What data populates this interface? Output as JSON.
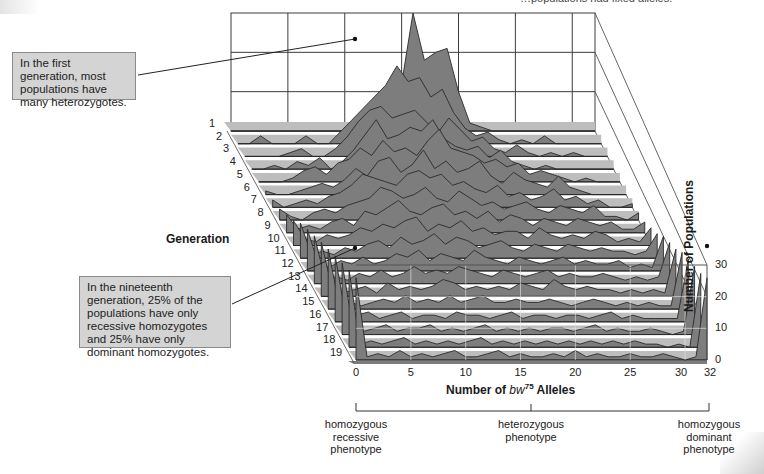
{
  "header_fragment": "…populations had fixed alleles.",
  "callouts": {
    "first": "In the first generation, most populations have many heterozygotes.",
    "nineteenth": "In the nineteenth generation, 25% of the populations have only recessive homozygotes and 25% have only dominant homozygotes."
  },
  "axes": {
    "generation_title": "Generation",
    "x_title_prefix": "Number of ",
    "x_title_gene": "bw",
    "x_title_sup": "75",
    "x_title_suffix": " Alleles",
    "y_title": "Number of Populations"
  },
  "phenotypes": {
    "recessive": "homozygous recessive phenotype",
    "heterozygous": "heterozygous phenotype",
    "dominant": "homozygous dominant phenotype"
  },
  "colors": {
    "fill": "#7d7d7d",
    "floor": "#bdbdbd",
    "edge": "#2a2a2a",
    "grid": "#3c3c3c",
    "front_grid": "#e8e8e8",
    "callout_bg": "#d4d4d4"
  },
  "chart_data": {
    "type": "area",
    "xlabel": "Number of bw75 Alleles",
    "ylabel": "Number of Populations",
    "zlabel": "Generation",
    "x_ticks": [
      "0",
      "5",
      "10",
      "15",
      "20",
      "25",
      "30",
      "32"
    ],
    "y_ticks": [
      "0",
      "10",
      "20",
      "30"
    ],
    "generation_ticks": [
      "1",
      "2",
      "3",
      "4",
      "5",
      "6",
      "7",
      "8",
      "9",
      "10",
      "11",
      "12",
      "13",
      "14",
      "15",
      "16",
      "17",
      "18",
      "19"
    ],
    "xlim": [
      0,
      32
    ],
    "ylim": [
      0,
      30
    ],
    "grid": true,
    "x": [
      0,
      1,
      2,
      3,
      4,
      5,
      6,
      7,
      8,
      9,
      10,
      11,
      12,
      13,
      14,
      15,
      16,
      17,
      18,
      19,
      20,
      21,
      22,
      23,
      24,
      25,
      26,
      27,
      28,
      29,
      30,
      31,
      32
    ],
    "series": [
      {
        "name": "Generation 1",
        "values": [
          0,
          0,
          0,
          0,
          0,
          0,
          0,
          0,
          0,
          0,
          0,
          0,
          2,
          4,
          8,
          12,
          30,
          18,
          20,
          21,
          10,
          2,
          1,
          0,
          0,
          0,
          0,
          0,
          0,
          0,
          0,
          0,
          0
        ]
      },
      {
        "name": "Generation 2",
        "values": [
          0,
          0,
          2,
          0,
          0,
          0,
          2,
          0,
          0,
          3,
          6,
          9,
          12,
          15,
          20,
          16,
          17,
          12,
          14,
          8,
          4,
          2,
          3,
          1,
          0,
          1,
          0,
          2,
          0,
          0,
          0,
          0,
          0
        ]
      },
      {
        "name": "Generation 3",
        "values": [
          0,
          0,
          0,
          0,
          1,
          2,
          0,
          0,
          2,
          5,
          9,
          12,
          13,
          10,
          11,
          12,
          9,
          6,
          10,
          7,
          4,
          5,
          2,
          1,
          3,
          1,
          0,
          1,
          0,
          1,
          0,
          0,
          0
        ]
      },
      {
        "name": "Generation 4",
        "values": [
          0,
          0,
          1,
          0,
          2,
          1,
          3,
          0,
          2,
          5,
          9,
          13,
          8,
          9,
          11,
          10,
          13,
          8,
          6,
          5,
          6,
          3,
          5,
          2,
          1,
          0,
          1,
          0,
          0,
          0,
          0,
          0,
          0
        ]
      },
      {
        "name": "Generation 5",
        "values": [
          0,
          0,
          0,
          1,
          3,
          4,
          2,
          5,
          6,
          9,
          7,
          11,
          8,
          9,
          7,
          11,
          14,
          9,
          8,
          7,
          5,
          6,
          4,
          5,
          2,
          3,
          2,
          1,
          0,
          1,
          0,
          0,
          0
        ]
      },
      {
        "name": "Generation 6",
        "values": [
          1,
          0,
          0,
          1,
          2,
          3,
          2,
          4,
          7,
          5,
          9,
          10,
          6,
          8,
          12,
          7,
          9,
          6,
          7,
          9,
          5,
          3,
          6,
          4,
          3,
          2,
          5,
          2,
          1,
          0,
          0,
          0,
          0
        ]
      },
      {
        "name": "Generation 7",
        "values": [
          2,
          0,
          1,
          2,
          1,
          3,
          4,
          6,
          9,
          8,
          7,
          6,
          9,
          10,
          8,
          9,
          6,
          7,
          5,
          4,
          6,
          3,
          4,
          2,
          3,
          5,
          2,
          3,
          1,
          2,
          0,
          0,
          1
        ]
      },
      {
        "name": "Generation 8",
        "values": [
          3,
          1,
          0,
          2,
          3,
          2,
          4,
          5,
          6,
          9,
          8,
          6,
          7,
          9,
          6,
          5,
          8,
          6,
          4,
          5,
          3,
          4,
          5,
          3,
          2,
          4,
          3,
          2,
          4,
          1,
          1,
          0,
          2
        ]
      },
      {
        "name": "Generation 9",
        "values": [
          5,
          1,
          2,
          1,
          3,
          4,
          2,
          6,
          5,
          7,
          9,
          6,
          5,
          7,
          8,
          5,
          6,
          4,
          6,
          3,
          5,
          4,
          2,
          4,
          3,
          2,
          4,
          3,
          2,
          3,
          1,
          1,
          3
        ]
      },
      {
        "name": "Generation 10",
        "values": [
          7,
          2,
          1,
          3,
          2,
          3,
          5,
          4,
          6,
          5,
          7,
          8,
          4,
          6,
          5,
          7,
          4,
          5,
          3,
          4,
          4,
          2,
          5,
          3,
          2,
          3,
          2,
          4,
          3,
          1,
          2,
          1,
          5
        ]
      },
      {
        "name": "Generation 11",
        "values": [
          10,
          1,
          2,
          1,
          3,
          2,
          4,
          5,
          3,
          6,
          4,
          5,
          7,
          4,
          6,
          5,
          3,
          4,
          5,
          3,
          2,
          4,
          3,
          2,
          4,
          3,
          2,
          3,
          2,
          2,
          1,
          2,
          7
        ]
      },
      {
        "name": "Generation 12",
        "values": [
          12,
          2,
          1,
          3,
          2,
          4,
          2,
          3,
          5,
          4,
          6,
          3,
          5,
          4,
          3,
          6,
          4,
          3,
          2,
          4,
          3,
          2,
          3,
          4,
          2,
          3,
          2,
          2,
          3,
          1,
          2,
          1,
          10
        ]
      },
      {
        "name": "Generation 13",
        "values": [
          14,
          1,
          2,
          1,
          3,
          2,
          4,
          2,
          3,
          5,
          3,
          4,
          3,
          5,
          4,
          3,
          2,
          4,
          3,
          2,
          3,
          4,
          2,
          3,
          2,
          2,
          3,
          2,
          1,
          2,
          1,
          2,
          12
        ]
      },
      {
        "name": "Generation 14",
        "values": [
          16,
          2,
          1,
          2,
          3,
          1,
          4,
          2,
          3,
          2,
          3,
          5,
          4,
          2,
          3,
          2,
          3,
          2,
          4,
          3,
          2,
          5,
          3,
          2,
          3,
          2,
          2,
          1,
          2,
          1,
          2,
          1,
          14
        ]
      },
      {
        "name": "Generation 15",
        "values": [
          18,
          1,
          2,
          1,
          2,
          3,
          2,
          4,
          2,
          3,
          2,
          4,
          2,
          3,
          4,
          2,
          2,
          3,
          2,
          2,
          3,
          2,
          1,
          2,
          3,
          2,
          1,
          2,
          1,
          2,
          1,
          1,
          17
        ]
      },
      {
        "name": "Generation 16",
        "values": [
          20,
          1,
          2,
          3,
          1,
          2,
          3,
          1,
          2,
          2,
          1,
          3,
          2,
          2,
          1,
          2,
          3,
          1,
          2,
          2,
          1,
          2,
          2,
          1,
          2,
          3,
          1,
          2,
          1,
          1,
          1,
          1,
          19
        ]
      },
      {
        "name": "Generation 17",
        "values": [
          22,
          2,
          1,
          2,
          3,
          1,
          2,
          2,
          3,
          1,
          2,
          1,
          2,
          3,
          1,
          2,
          1,
          2,
          1,
          2,
          2,
          1,
          2,
          3,
          1,
          2,
          1,
          1,
          2,
          1,
          0,
          1,
          21
        ]
      },
      {
        "name": "Generation 18",
        "values": [
          24,
          1,
          2,
          1,
          2,
          3,
          1,
          2,
          1,
          2,
          1,
          2,
          3,
          1,
          2,
          1,
          2,
          1,
          2,
          1,
          2,
          1,
          2,
          1,
          2,
          1,
          2,
          1,
          1,
          0,
          1,
          0,
          23
        ]
      },
      {
        "name": "Generation 19",
        "values": [
          26,
          1,
          2,
          1,
          3,
          1,
          2,
          1,
          2,
          3,
          1,
          1,
          2,
          3,
          1,
          2,
          1,
          1,
          2,
          1,
          3,
          1,
          2,
          1,
          1,
          2,
          1,
          1,
          2,
          1,
          0,
          1,
          26
        ]
      }
    ],
    "annotations": [
      "In the first generation, most populations have many heterozygotes.",
      "In the nineteenth generation, 25% of the populations have only recessive homozygotes and 25% have only dominant homozygotes."
    ]
  }
}
